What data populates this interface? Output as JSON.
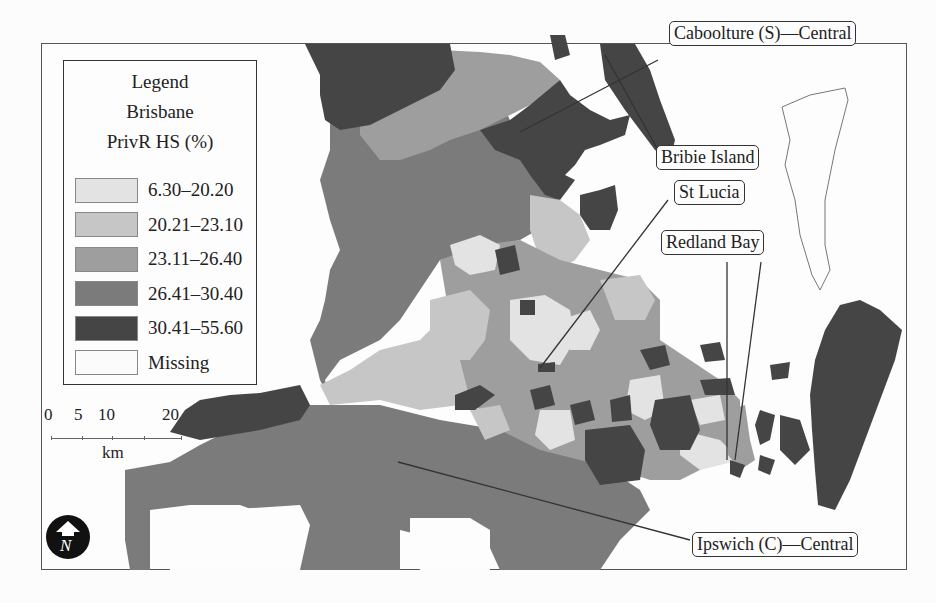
{
  "legend": {
    "heading": "Legend",
    "region": "Brisbane",
    "variable": "PrivR HS (%)",
    "classes": [
      {
        "label": "6.30–20.20",
        "color": "#e3e3e3"
      },
      {
        "label": "20.21–23.10",
        "color": "#c6c6c6"
      },
      {
        "label": "23.11–26.40",
        "color": "#9e9e9e"
      },
      {
        "label": "26.41–30.40",
        "color": "#7b7b7b"
      },
      {
        "label": "30.41–55.60",
        "color": "#454545"
      },
      {
        "label": "Missing",
        "color": "#fbfbfb"
      }
    ]
  },
  "scalebar": {
    "ticks": [
      "0",
      "5",
      "10",
      "20"
    ],
    "unit": "km"
  },
  "north_arrow": {
    "label": "N"
  },
  "callouts": [
    {
      "id": "caboolture",
      "label": "Caboolture (S)—Central"
    },
    {
      "id": "bribie",
      "label": "Bribie Island"
    },
    {
      "id": "stlucia",
      "label": "St Lucia"
    },
    {
      "id": "redland",
      "label": "Redland Bay"
    },
    {
      "id": "ipswich",
      "label": "Ipswich (C)—Central"
    }
  ]
}
